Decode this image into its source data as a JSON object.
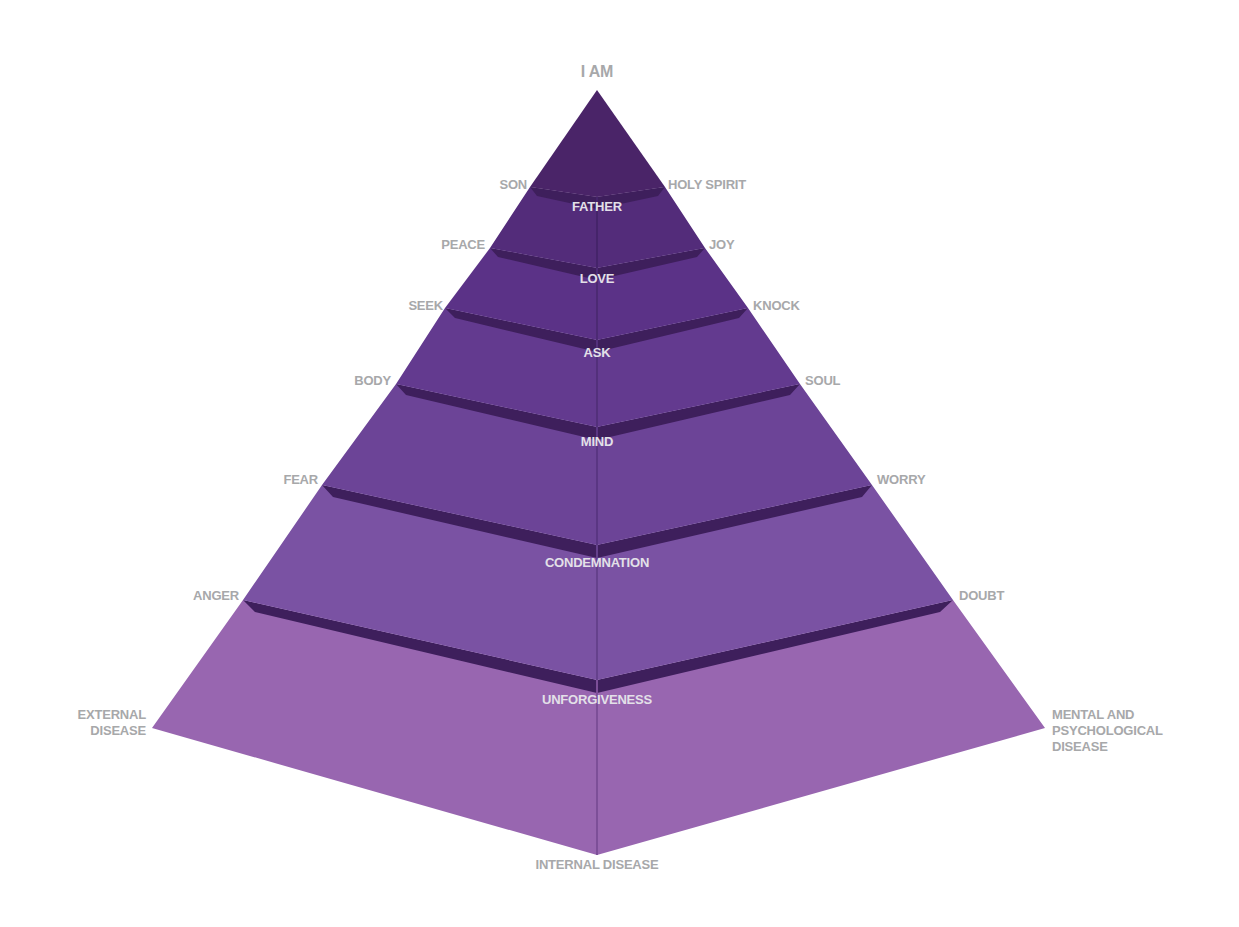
{
  "diagram": {
    "type": "pyramid",
    "apex_label": "I AM",
    "base_label": "INTERNAL DISEASE",
    "colors": {
      "label_gray": "#a7a8aa",
      "inner_label": "#e3e0e8",
      "band_dark": "#3e1f5c",
      "layer_1": "#4a2468",
      "layer_2": "#532c7a",
      "layer_3": "#5b3287",
      "layer_4": "#633a8f",
      "layer_5": "#6c4497",
      "layer_6": "#7a52a3",
      "layer_7": "#9866b0"
    },
    "layers": [
      {
        "center": "",
        "left": "SON",
        "right": "HOLY SPIRIT"
      },
      {
        "center": "FATHER",
        "left": "PEACE",
        "right": "JOY"
      },
      {
        "center": "LOVE",
        "left": "SEEK",
        "right": "KNOCK"
      },
      {
        "center": "ASK",
        "left": "BODY",
        "right": "SOUL"
      },
      {
        "center": "MIND",
        "left": "FEAR",
        "right": "WORRY"
      },
      {
        "center": "CONDEMNATION",
        "left": "ANGER",
        "right": "DOUBT"
      },
      {
        "center": "UNFORGIVENESS",
        "left_lines": [
          "EXTERNAL",
          "DISEASE"
        ],
        "right_lines": [
          "MENTAL AND",
          "PSYCHOLOGICAL",
          "DISEASE"
        ]
      }
    ]
  }
}
